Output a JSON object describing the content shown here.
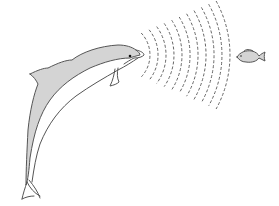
{
  "illustration": {
    "subject": "dolphin echolocation",
    "elements": [
      "dolphin",
      "sound-waves",
      "fish"
    ],
    "colors": {
      "outline": "#555555",
      "body_fill": "#d4d4d4",
      "wave_stroke": "#666666",
      "background": "#ffffff"
    },
    "wave_count": 11
  }
}
